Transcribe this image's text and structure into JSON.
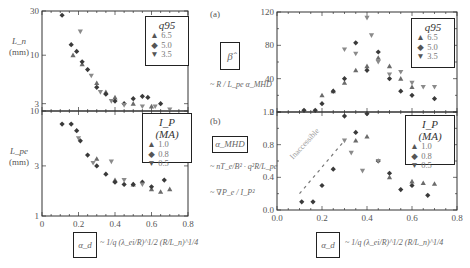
{
  "panels": {
    "a": {
      "tag": "(a)",
      "box_label": "β̂",
      "formula": "~ R / L_pe  α_MHD"
    },
    "b": {
      "tag": "(b)",
      "box_label": "α_MHD",
      "formula1": "~ nT_e/B² · q²R/L_pe",
      "formula2": "~ ∇P_e / I_P²"
    }
  },
  "left": {
    "top_ylabel": "L_n",
    "top_yunit": "(mm)",
    "bottom_ylabel": "L_pe",
    "bottom_yunit": "(mm)",
    "xlabel_box": "α_d",
    "xlabel_formula": "~ 1/q (λ_ei/R)^1/2 (R/L_n)^1/4"
  },
  "right": {
    "xlabel_box": "α_d",
    "xlabel_formula": "~ 1/q (λ_ei/R)^1/2 (R/L_n)^1/4",
    "annotation": "Inaccessible"
  },
  "legends": {
    "q95": {
      "title": "q95",
      "entries": [
        {
          "marker": "▲",
          "label": "6.5"
        },
        {
          "marker": "◆",
          "label": "5.0"
        },
        {
          "marker": "▼",
          "label": "3.5"
        }
      ]
    },
    "ip": {
      "title": "I_P (MA)",
      "entries": [
        {
          "marker": "▲",
          "label": "1.0"
        },
        {
          "marker": "◆",
          "label": "0.8"
        },
        {
          "marker": "▼",
          "label": "0.5"
        }
      ]
    }
  },
  "chart_data": [
    {
      "type": "scatter",
      "title": "L_n vs alpha_d",
      "xlabel": "alpha_d",
      "ylabel": "L_n (mm)",
      "xlim": [
        0,
        0.8
      ],
      "ylim": [
        2.5,
        30
      ],
      "yscale": "log",
      "xticks": [
        0,
        0.2,
        0.4,
        0.6,
        0.8
      ],
      "yticks": [
        3,
        10,
        30
      ],
      "legend": {
        "title": "q95",
        "position": "upper right"
      },
      "series": [
        {
          "name": "6.5",
          "marker": "triangle-up",
          "points": [
            [
              0.17,
              10
            ],
            [
              0.22,
              8
            ],
            [
              0.3,
              5
            ],
            [
              0.35,
              4
            ],
            [
              0.4,
              3.5
            ],
            [
              0.5,
              3
            ],
            [
              0.6,
              2.8
            ]
          ]
        },
        {
          "name": "5.0",
          "marker": "diamond",
          "points": [
            [
              0.11,
              27
            ],
            [
              0.16,
              13
            ],
            [
              0.19,
              11
            ],
            [
              0.22,
              8.5
            ],
            [
              0.25,
              7
            ],
            [
              0.3,
              4.5
            ],
            [
              0.35,
              3.8
            ],
            [
              0.4,
              3.2
            ],
            [
              0.45,
              3
            ],
            [
              0.5,
              3.4
            ],
            [
              0.55,
              3.6
            ],
            [
              0.58,
              3.5
            ],
            [
              0.65,
              3
            ]
          ]
        },
        {
          "name": "3.5",
          "marker": "triangle-down",
          "points": [
            [
              0.21,
              18
            ],
            [
              0.27,
              6
            ],
            [
              0.32,
              4
            ],
            [
              0.38,
              3.2
            ],
            [
              0.45,
              2.9
            ],
            [
              0.55,
              2.8
            ],
            [
              0.62,
              2.8
            ],
            [
              0.7,
              2.6
            ]
          ]
        }
      ]
    },
    {
      "type": "scatter",
      "title": "L_pe vs alpha_d",
      "xlabel": "alpha_d",
      "ylabel": "L_pe (mm)",
      "xlim": [
        0,
        0.8
      ],
      "ylim": [
        1,
        10
      ],
      "yscale": "log",
      "xticks": [
        0,
        0.2,
        0.4,
        0.6,
        0.8
      ],
      "yticks": [
        1,
        3,
        10
      ],
      "legend": {
        "title": "I_P (MA)",
        "position": "upper right"
      },
      "series": [
        {
          "name": "1.0",
          "marker": "triangle-up",
          "points": [
            [
              0.3,
              3.5
            ],
            [
              0.4,
              2.2
            ],
            [
              0.5,
              2
            ],
            [
              0.6,
              1.8
            ],
            [
              0.65,
              1.7
            ],
            [
              0.7,
              1.8
            ]
          ]
        },
        {
          "name": "0.8",
          "marker": "diamond",
          "points": [
            [
              0.11,
              7.5
            ],
            [
              0.16,
              7.5
            ],
            [
              0.19,
              6.5
            ],
            [
              0.21,
              5.2
            ],
            [
              0.25,
              3.8
            ],
            [
              0.3,
              3
            ],
            [
              0.35,
              2.5
            ],
            [
              0.4,
              2.1
            ],
            [
              0.45,
              2
            ],
            [
              0.5,
              2
            ],
            [
              0.55,
              2.1
            ],
            [
              0.6,
              1.9
            ],
            [
              0.67,
              2.2
            ]
          ]
        },
        {
          "name": "0.5",
          "marker": "triangle-down",
          "points": [
            [
              0.2,
              5.5
            ],
            [
              0.28,
              3.2
            ],
            [
              0.38,
              3.3
            ],
            [
              0.45,
              2.2
            ],
            [
              0.55,
              2
            ]
          ]
        }
      ]
    },
    {
      "type": "scatter",
      "title": "beta_hat vs alpha_d",
      "xlabel": "alpha_d",
      "ylabel": "beta_hat",
      "xlim": [
        0,
        0.8
      ],
      "ylim": [
        0,
        120
      ],
      "xticks": [
        0.0,
        0.2,
        0.4,
        0.6,
        0.8
      ],
      "yticks": [
        0,
        40,
        80,
        120
      ],
      "legend": {
        "title": "q95",
        "position": "upper right"
      },
      "series": [
        {
          "name": "6.5",
          "marker": "triangle-up",
          "points": [
            [
              0.2,
              20
            ],
            [
              0.25,
              25
            ],
            [
              0.3,
              35
            ],
            [
              0.35,
              50
            ],
            [
              0.4,
              55
            ],
            [
              0.45,
              65
            ],
            [
              0.5,
              55
            ],
            [
              0.55,
              40
            ],
            [
              0.6,
              30
            ]
          ]
        },
        {
          "name": "5.0",
          "marker": "diamond",
          "points": [
            [
              0.12,
              2
            ],
            [
              0.17,
              2
            ],
            [
              0.2,
              10
            ],
            [
              0.25,
              25
            ],
            [
              0.3,
              40
            ],
            [
              0.35,
              83
            ],
            [
              0.4,
              50
            ],
            [
              0.45,
              72
            ],
            [
              0.5,
              40
            ],
            [
              0.55,
              25
            ],
            [
              0.6,
              20
            ],
            [
              0.7,
              16
            ]
          ]
        },
        {
          "name": "3.5",
          "marker": "triangle-down",
          "points": [
            [
              0.3,
              75
            ],
            [
              0.35,
              70
            ],
            [
              0.4,
              113
            ],
            [
              0.42,
              92
            ],
            [
              0.45,
              60
            ],
            [
              0.5,
              45
            ],
            [
              0.55,
              48
            ],
            [
              0.6,
              35
            ],
            [
              0.65,
              30
            ],
            [
              0.7,
              30
            ]
          ]
        }
      ]
    },
    {
      "type": "scatter",
      "title": "alpha_MHD vs alpha_d",
      "xlabel": "alpha_d",
      "ylabel": "alpha_MHD",
      "xlim": [
        0,
        0.8
      ],
      "ylim": [
        0,
        1.2
      ],
      "xticks": [
        0.0,
        0.2,
        0.4,
        0.6,
        0.8
      ],
      "yticks": [
        0.0,
        0.4,
        0.8,
        1.2
      ],
      "legend": {
        "title": "I_P (MA)",
        "position": "upper right"
      },
      "annotations": [
        {
          "text": "Inaccessible",
          "type": "dashed line boundary",
          "from": [
            0.1,
            0.2
          ],
          "to": [
            0.3,
            0.85
          ]
        }
      ],
      "series": [
        {
          "name": "1.0",
          "marker": "triangle-up",
          "points": [
            [
              0.35,
              0.85
            ],
            [
              0.4,
              0.9
            ],
            [
              0.5,
              0.4
            ],
            [
              0.6,
              0.35
            ],
            [
              0.65,
              0.33
            ],
            [
              0.7,
              0.32
            ]
          ]
        },
        {
          "name": "0.8",
          "marker": "diamond",
          "points": [
            [
              0.11,
              0.1
            ],
            [
              0.16,
              0.1
            ],
            [
              0.2,
              0.3
            ],
            [
              0.25,
              0.5
            ],
            [
              0.3,
              1.15
            ],
            [
              0.35,
              0.95
            ],
            [
              0.4,
              1.18
            ],
            [
              0.45,
              0.6
            ],
            [
              0.5,
              0.45
            ],
            [
              0.55,
              0.25
            ],
            [
              0.6,
              0.3
            ],
            [
              0.67,
              0.18
            ]
          ]
        },
        {
          "name": "0.5",
          "marker": "triangle-down",
          "points": [
            [
              0.3,
              0.85
            ],
            [
              0.33,
              0.7
            ],
            [
              0.38,
              0.48
            ],
            [
              0.45,
              0.6
            ]
          ]
        }
      ]
    }
  ]
}
